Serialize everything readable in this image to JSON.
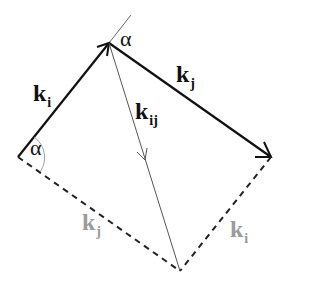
{
  "diagram": {
    "colors": {
      "solid": "#111111",
      "thin": "#555555",
      "dashed": "#222222",
      "light_label": "#9a9a9a",
      "arc": "#888888"
    },
    "labels": {
      "ki_top": {
        "base": "k",
        "sub": "i"
      },
      "kj_top": {
        "base": "k",
        "sub": "j"
      },
      "kij": {
        "base": "k",
        "sub": "ij"
      },
      "kj_bottom": {
        "base": "k",
        "sub": "j"
      },
      "ki_bottom": {
        "base": "k",
        "sub": "i"
      },
      "alpha_top": "α",
      "alpha_left": "α"
    },
    "points": {
      "left": [
        18,
        157
      ],
      "top": [
        109,
        43
      ],
      "right": [
        271,
        157
      ],
      "bottom": [
        180,
        271
      ],
      "extension_end": [
        131,
        15
      ]
    }
  }
}
